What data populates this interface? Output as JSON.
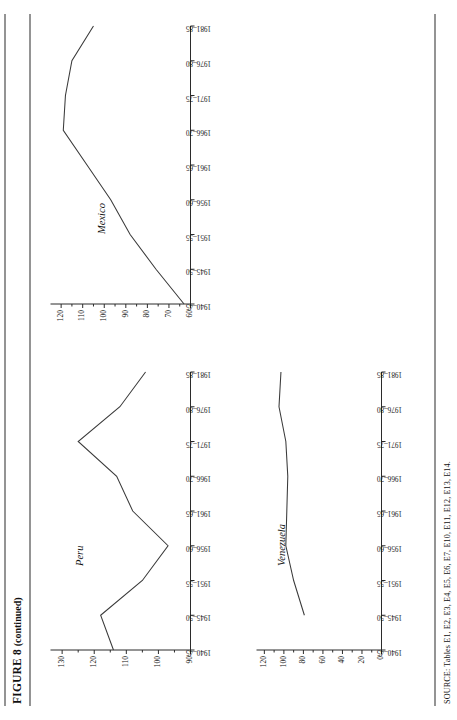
{
  "figure": {
    "label": "FIGURE 8",
    "continued": "(continued)"
  },
  "source": {
    "text": "SOURCE: Tables E1, E2, E3, E4, E5, E6, E7, E10, E11, E12, E13, E14."
  },
  "chart_data": [
    {
      "type": "line",
      "title": "Peru",
      "xlabel": "",
      "ylabel": "",
      "grid": false,
      "legend": "none",
      "categories": [
        "1940-45",
        "1945-50",
        "1951-55",
        "1956-60",
        "1961-65",
        "1966-70",
        "1971-75",
        "1976-80",
        "1981-85"
      ],
      "xticklabels": [
        "1940–45",
        "1945–50",
        "1951–55",
        "1956–60",
        "1961–65",
        "1966–70",
        "1971–75",
        "1976–80",
        "1981–85"
      ],
      "yticks": [
        90,
        100,
        110,
        120,
        130
      ],
      "yticklabels": [
        "90",
        "100",
        "110",
        "120",
        "130"
      ],
      "ylim": [
        90,
        133
      ],
      "values": [
        114,
        118,
        105,
        97,
        108,
        113,
        125,
        112,
        104
      ]
    },
    {
      "type": "line",
      "title": "Mexico",
      "xlabel": "",
      "ylabel": "",
      "grid": false,
      "legend": "none",
      "categories": [
        "1940-45",
        "1945-50",
        "1951-55",
        "1956-60",
        "1961-65",
        "1966-70",
        "1971-75",
        "1976-80",
        "1981-85"
      ],
      "xticklabels": [
        "1940–45",
        "1945–50",
        "1951–55",
        "1956–60",
        "1961–65",
        "1966–70",
        "1971–75",
        "1976–80",
        "1981–85"
      ],
      "yticks": [
        60,
        70,
        80,
        90,
        100,
        110,
        120
      ],
      "yticklabels": [
        "60",
        "70",
        "80",
        "90",
        "100",
        "110",
        "120"
      ],
      "ylim": [
        60,
        124
      ],
      "values": [
        63,
        76,
        88,
        97,
        108,
        119,
        118,
        115,
        105
      ]
    },
    {
      "type": "line",
      "title": "Venezuela",
      "xlabel": "",
      "ylabel": "",
      "grid": false,
      "legend": "none",
      "categories": [
        "1940-45",
        "1945-50",
        "1951-55",
        "1956-60",
        "1961-65",
        "1966-70",
        "1971-75",
        "1976-80",
        "1981-85"
      ],
      "xticklabels": [
        "1940–45",
        "1945–50",
        "1951–55",
        "1956–60",
        "1961–65",
        "1966–70",
        "1971–75",
        "1976–80",
        "1981–85"
      ],
      "yticks": [
        0,
        20,
        40,
        60,
        80,
        100,
        120
      ],
      "yticklabels": [
        "0",
        "20",
        "40",
        "60",
        "80",
        "100",
        "120"
      ],
      "ylim": [
        0,
        126
      ],
      "values": [
        null,
        79,
        90,
        98,
        97,
        96,
        98,
        105,
        103
      ]
    }
  ]
}
